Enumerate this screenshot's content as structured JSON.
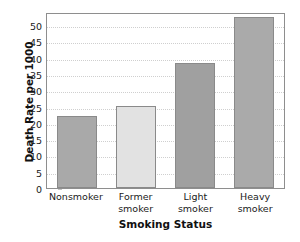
{
  "chart_data": {
    "type": "bar",
    "title": "",
    "xlabel": "Smoking Status",
    "ylabel": "Death Rate per 1000",
    "categories": [
      "Nonsmoker",
      "Former smoker",
      "Light smoker",
      "Heavy smoker"
    ],
    "category_lines": [
      [
        "Nonsmoker",
        ""
      ],
      [
        "Former",
        "smoker"
      ],
      [
        "Light",
        "smoker"
      ],
      [
        "Heavy",
        "smoker"
      ]
    ],
    "values": [
      22,
      25.2,
      38.5,
      52.5
    ],
    "bar_colors": [
      "#a9a9a9",
      "#e2e2e2",
      "#a0a0a0",
      "#aaaaaa"
    ],
    "bar_border_color": "#8a8a8a",
    "ylim": [
      0,
      54
    ],
    "yticks": [
      0,
      5,
      10,
      15,
      20,
      25,
      30,
      35,
      40,
      45,
      50
    ],
    "ytick_labels": [
      "0",
      "5",
      "10",
      "15",
      "20",
      "25",
      "30",
      "35",
      "40",
      "45",
      "50"
    ],
    "grid": true,
    "grid_color": "#cfcfcf",
    "legend": null,
    "frame_color": "#8e8e8e",
    "background": "#ffffff"
  }
}
